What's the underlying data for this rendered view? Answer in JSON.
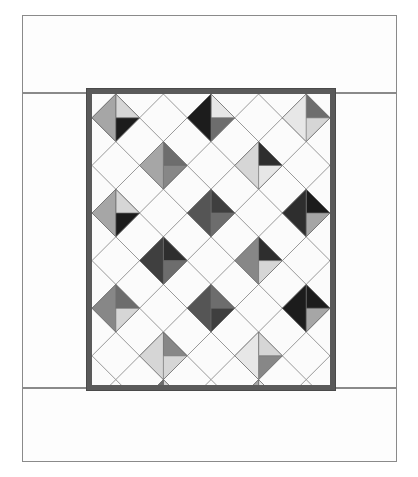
{
  "page": {
    "width": 418,
    "height": 477,
    "background": "#ffffff"
  },
  "outer_border": {
    "name": "pieced outer border",
    "fabric_color": "#fdfdfd",
    "seam_line_color": "#8a8a8a",
    "strips": [
      {
        "label": "top border strip",
        "x": 22,
        "y": 15,
        "w": 375,
        "h": 78
      },
      {
        "label": "left border strip",
        "x": 22,
        "y": 93,
        "w": 70,
        "h": 295
      },
      {
        "label": "right border strip",
        "x": 330,
        "y": 93,
        "w": 67,
        "h": 295
      },
      {
        "label": "bottom border strip",
        "x": 22,
        "y": 388,
        "w": 375,
        "h": 74
      }
    ]
  },
  "binding": {
    "label": "inner frame / binding",
    "color": "#5a5a5a",
    "x": 86,
    "y": 88,
    "w": 250,
    "h": 303,
    "thickness": 6
  },
  "quilt_center": {
    "label": "on-point four-patch quilt center",
    "x": 92,
    "y": 94,
    "w": 238,
    "h": 291,
    "background_color": "#fbfbfb",
    "seam_line_color": "#6e6e6e",
    "grid": {
      "pitch": 47.6,
      "origin_x": -23.8,
      "origin_y": -23.8,
      "cols": 6,
      "rows": 7
    }
  },
  "palette": {
    "white": "#fbfbfb",
    "near_black": "#1c1c1c",
    "very_dark": "#2e2e2e",
    "dark": "#3f3f3f",
    "mid_dark": "#555555",
    "mid": "#6d6d6d",
    "mid_light": "#878787",
    "light": "#a6a6a6",
    "lighter": "#bfbfbf",
    "pale": "#d6d6d6",
    "very_pale": "#e7e7e7"
  },
  "chart_data": {
    "type": "heatmap",
    "xlabel": "diagonal column",
    "ylabel": "diagonal row",
    "grid_cols": 6,
    "grid_rows": 7,
    "note": "Each cell is a diamond (square rotated 45 degrees). Cells marked 'plain' are solid white alabaster squares. Cells marked 'fourpatch' carry four grayscale quadrants listed clockwise from top quadrant: [top, right, bottom, left].",
    "cells": [
      {
        "r": 0,
        "c": 0,
        "kind": "fourpatch",
        "quads": [
          "light",
          "mid_light",
          "white",
          "pale"
        ]
      },
      {
        "r": 0,
        "c": 1,
        "kind": "plain"
      },
      {
        "r": 0,
        "c": 2,
        "kind": "fourpatch",
        "quads": [
          "mid",
          "mid_light",
          "pale",
          "light"
        ]
      },
      {
        "r": 0,
        "c": 3,
        "kind": "plain"
      },
      {
        "r": 0,
        "c": 4,
        "kind": "fourpatch",
        "quads": [
          "mid_dark",
          "mid",
          "light",
          "mid_light"
        ]
      },
      {
        "r": 0,
        "c": 5,
        "kind": "plain"
      },
      {
        "r": 1,
        "c": 0,
        "kind": "plain"
      },
      {
        "r": 1,
        "c": 1,
        "kind": "fourpatch",
        "quads": [
          "near_black",
          "pale",
          "near_black",
          "light"
        ]
      },
      {
        "r": 1,
        "c": 2,
        "kind": "plain"
      },
      {
        "r": 1,
        "c": 3,
        "kind": "fourpatch",
        "quads": [
          "near_black",
          "very_pale",
          "mid",
          "near_black"
        ]
      },
      {
        "r": 1,
        "c": 4,
        "kind": "plain"
      },
      {
        "r": 1,
        "c": 5,
        "kind": "fourpatch",
        "quads": [
          "light",
          "mid",
          "pale",
          "very_pale"
        ]
      },
      {
        "r": 2,
        "c": 0,
        "kind": "fourpatch",
        "quads": [
          "mid_light",
          "pale",
          "white",
          "light"
        ]
      },
      {
        "r": 2,
        "c": 1,
        "kind": "plain"
      },
      {
        "r": 2,
        "c": 2,
        "kind": "fourpatch",
        "quads": [
          "pale",
          "mid",
          "mid_light",
          "light"
        ]
      },
      {
        "r": 2,
        "c": 3,
        "kind": "plain"
      },
      {
        "r": 2,
        "c": 4,
        "kind": "fourpatch",
        "quads": [
          "mid_dark",
          "very_dark",
          "very_pale",
          "pale"
        ]
      },
      {
        "r": 2,
        "c": 5,
        "kind": "plain"
      },
      {
        "r": 3,
        "c": 0,
        "kind": "plain"
      },
      {
        "r": 3,
        "c": 1,
        "kind": "fourpatch",
        "quads": [
          "near_black",
          "pale",
          "near_black",
          "light"
        ]
      },
      {
        "r": 3,
        "c": 2,
        "kind": "plain"
      },
      {
        "r": 3,
        "c": 3,
        "kind": "fourpatch",
        "quads": [
          "mid_dark",
          "dark",
          "mid",
          "mid_dark"
        ]
      },
      {
        "r": 3,
        "c": 4,
        "kind": "plain"
      },
      {
        "r": 3,
        "c": 5,
        "kind": "fourpatch",
        "quads": [
          "pale",
          "near_black",
          "light",
          "very_dark"
        ]
      },
      {
        "r": 4,
        "c": 0,
        "kind": "fourpatch",
        "quads": [
          "mid",
          "light",
          "white",
          "pale"
        ]
      },
      {
        "r": 4,
        "c": 1,
        "kind": "plain"
      },
      {
        "r": 4,
        "c": 2,
        "kind": "fourpatch",
        "quads": [
          "mid_dark",
          "very_dark",
          "mid",
          "dark"
        ]
      },
      {
        "r": 4,
        "c": 3,
        "kind": "plain"
      },
      {
        "r": 4,
        "c": 4,
        "kind": "fourpatch",
        "quads": [
          "very_pale",
          "very_dark",
          "pale",
          "mid_light"
        ]
      },
      {
        "r": 4,
        "c": 5,
        "kind": "plain"
      },
      {
        "r": 5,
        "c": 0,
        "kind": "plain"
      },
      {
        "r": 5,
        "c": 1,
        "kind": "fourpatch",
        "quads": [
          "light",
          "mid",
          "pale",
          "mid_light"
        ]
      },
      {
        "r": 5,
        "c": 2,
        "kind": "plain"
      },
      {
        "r": 5,
        "c": 3,
        "kind": "fourpatch",
        "quads": [
          "very_dark",
          "mid",
          "dark",
          "mid_dark"
        ]
      },
      {
        "r": 5,
        "c": 4,
        "kind": "plain"
      },
      {
        "r": 5,
        "c": 5,
        "kind": "fourpatch",
        "quads": [
          "mid_dark",
          "near_black",
          "light",
          "near_black"
        ]
      },
      {
        "r": 6,
        "c": 0,
        "kind": "fourpatch",
        "quads": [
          "near_black",
          "light",
          "white",
          "mid_light"
        ]
      },
      {
        "r": 6,
        "c": 1,
        "kind": "plain"
      },
      {
        "r": 6,
        "c": 2,
        "kind": "fourpatch",
        "quads": [
          "very_dark",
          "mid_light",
          "pale",
          "pale"
        ]
      },
      {
        "r": 6,
        "c": 3,
        "kind": "plain"
      },
      {
        "r": 6,
        "c": 4,
        "kind": "fourpatch",
        "quads": [
          "mid",
          "pale",
          "mid_light",
          "very_pale"
        ]
      },
      {
        "r": 6,
        "c": 5,
        "kind": "plain"
      },
      {
        "r": 0,
        "c": 6,
        "kind": "fourpatch",
        "quads": [
          "mid_light",
          "white",
          "pale",
          "mid"
        ]
      },
      {
        "r": 1,
        "c": 6,
        "kind": "plain"
      },
      {
        "r": 2,
        "c": 6,
        "kind": "fourpatch",
        "quads": [
          "very_dark",
          "white",
          "mid_light",
          "near_black"
        ]
      },
      {
        "r": 3,
        "c": 6,
        "kind": "plain"
      },
      {
        "r": 4,
        "c": 6,
        "kind": "fourpatch",
        "quads": [
          "mid_dark",
          "white",
          "light",
          "very_dark"
        ]
      },
      {
        "r": 5,
        "c": 6,
        "kind": "plain"
      },
      {
        "r": 6,
        "c": 6,
        "kind": "fourpatch",
        "quads": [
          "light",
          "white",
          "mid_light",
          "pale"
        ]
      },
      {
        "r": 7,
        "c": 0,
        "kind": "fourpatch",
        "quads": [
          "near_black",
          "light",
          "white",
          "mid_light"
        ]
      },
      {
        "r": 7,
        "c": 1,
        "kind": "plain"
      },
      {
        "r": 7,
        "c": 2,
        "kind": "fourpatch",
        "quads": [
          "very_dark",
          "pale",
          "white",
          "mid"
        ]
      },
      {
        "r": 7,
        "c": 3,
        "kind": "plain"
      },
      {
        "r": 7,
        "c": 4,
        "kind": "fourpatch",
        "quads": [
          "mid_dark",
          "very_pale",
          "white",
          "light"
        ]
      },
      {
        "r": 7,
        "c": 5,
        "kind": "plain"
      },
      {
        "r": 7,
        "c": 6,
        "kind": "fourpatch",
        "quads": [
          "mid",
          "white",
          "white",
          "light"
        ]
      }
    ]
  }
}
